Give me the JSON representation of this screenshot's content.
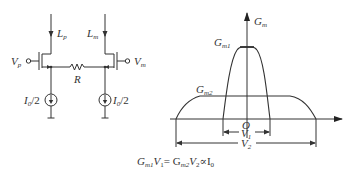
{
  "circuit": {
    "labels": {
      "left_current": "L",
      "left_current_sub": "p",
      "right_current": "L",
      "right_current_sub": "m",
      "left_input": "V",
      "left_input_sub": "p",
      "right_input": "V",
      "right_input_sub": "m",
      "resistor": "R",
      "left_source": "I",
      "left_source_sub": "0",
      "left_source_suffix": "/2",
      "right_source": "I",
      "right_source_sub": "0",
      "right_source_suffix": "/2"
    }
  },
  "graph": {
    "y_axis_label": "G",
    "y_axis_label_sub": "m",
    "origin_label": "O",
    "peak_label": "G",
    "peak_label_sub": "m1",
    "plateau_label": "G",
    "plateau_label_sub": "m2",
    "narrow_width_label": "V",
    "narrow_width_label_sub": "1",
    "wide_width_label": "V",
    "wide_width_label_sub": "2"
  },
  "formula": {
    "text": "G",
    "parts": [
      {
        "t": "G",
        "s": "m1"
      },
      {
        "t": "V",
        "s": "1"
      },
      {
        "t": "= G",
        "s": "m2"
      },
      {
        "t": "V",
        "s": "2"
      },
      {
        "t": "∝I",
        "s": "0"
      }
    ]
  },
  "colors": {
    "ink": "#333333",
    "background": "#ffffff"
  }
}
